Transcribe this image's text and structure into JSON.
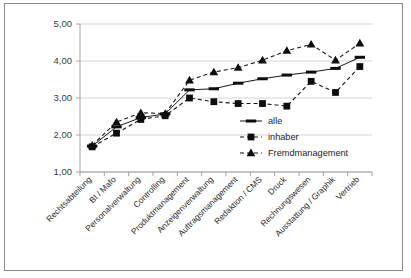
{
  "chart_data": {
    "type": "line",
    "title": "",
    "xlabel": "",
    "ylabel": "",
    "ylim": [
      1.0,
      5.0
    ],
    "yticks": [
      1.0,
      2.0,
      3.0,
      4.0,
      5.0
    ],
    "ytick_labels": [
      "1,00",
      "2,00",
      "3,00",
      "4,00",
      "5,00"
    ],
    "grid": true,
    "legend_position": "center-right",
    "categories": [
      "Rechtsabteilung",
      "BI / Mafo",
      "Personalverwaltung",
      "Controlling",
      "Produktmanagement",
      "Anzeigenverwaltung",
      "Auftragsmanagement",
      "Redaktion / CMS",
      "Druck",
      "Rechnungswesen",
      "Ausstattung / Graphik",
      "Vertrieb"
    ],
    "series": [
      {
        "name": "alle",
        "marker": "dash",
        "linestyle": "solid",
        "values": [
          1.7,
          2.22,
          2.47,
          2.57,
          3.22,
          3.25,
          3.4,
          3.52,
          3.62,
          3.7,
          3.8,
          4.1
        ]
      },
      {
        "name": "inhaber",
        "marker": "square",
        "linestyle": "dashed",
        "values": [
          1.68,
          2.05,
          2.42,
          2.52,
          3.0,
          2.9,
          2.85,
          2.85,
          2.78,
          3.45,
          3.15,
          3.85
        ]
      },
      {
        "name": "Fremdmanagement",
        "marker": "triangle",
        "linestyle": "dashed",
        "values": [
          1.72,
          2.35,
          2.6,
          2.58,
          3.48,
          3.7,
          3.82,
          4.02,
          4.28,
          4.45,
          4.02,
          4.48
        ]
      }
    ]
  },
  "legend": {
    "items": [
      {
        "label": "alle",
        "marker": "dash"
      },
      {
        "label": "inhaber",
        "marker": "square"
      },
      {
        "label": "Fremdmanagement",
        "marker": "triangle"
      }
    ]
  }
}
